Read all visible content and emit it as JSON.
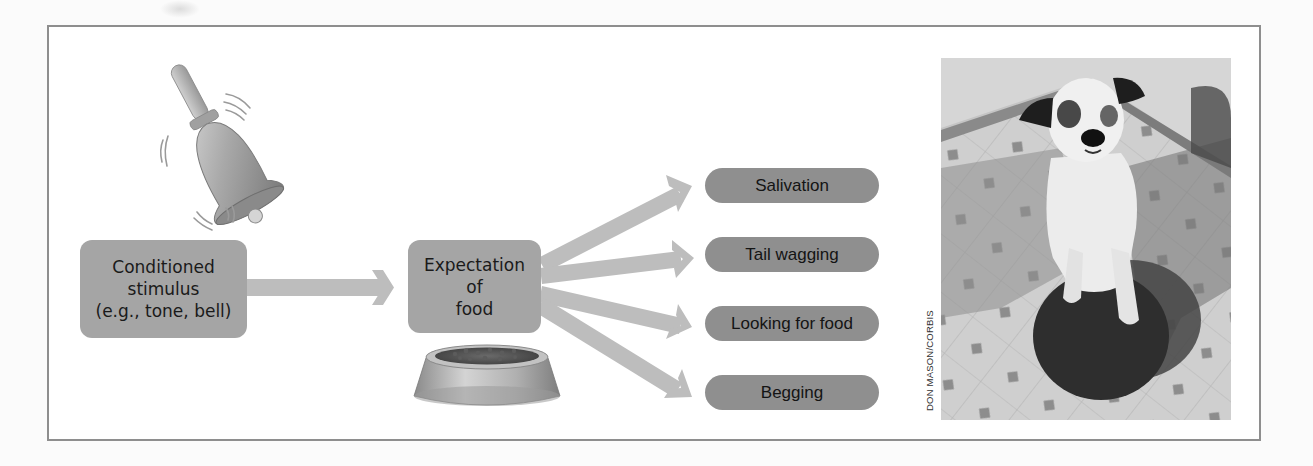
{
  "figure": {
    "colors": {
      "box_fill": "#a5a5a5",
      "pill_fill": "#8f8f8f",
      "arrow_fill": "#bdbdbd",
      "frame_border": "#8e8e8e",
      "text": "#1a1a1a"
    },
    "illustrations": {
      "bell": "bell-icon",
      "bowl": "food-bowl-icon"
    },
    "nodes": {
      "stimulus": {
        "label": "Conditioned\nstimulus\n(e.g., tone, bell)"
      },
      "expectation": {
        "label": "Expectation\nof\nfood"
      }
    },
    "responses": [
      {
        "label": "Salivation"
      },
      {
        "label": "Tail wagging"
      },
      {
        "label": "Looking for food"
      },
      {
        "label": "Begging"
      }
    ],
    "edges": [
      {
        "from": "stimulus",
        "to": "expectation"
      },
      {
        "from": "expectation",
        "to": "Salivation"
      },
      {
        "from": "expectation",
        "to": "Tail wagging"
      },
      {
        "from": "expectation",
        "to": "Looking for food"
      },
      {
        "from": "expectation",
        "to": "Begging"
      }
    ],
    "photo": {
      "subject": "dog-sitting-with-paw-on-food-bowl",
      "credit": "DON MASON/CORBIS"
    }
  }
}
